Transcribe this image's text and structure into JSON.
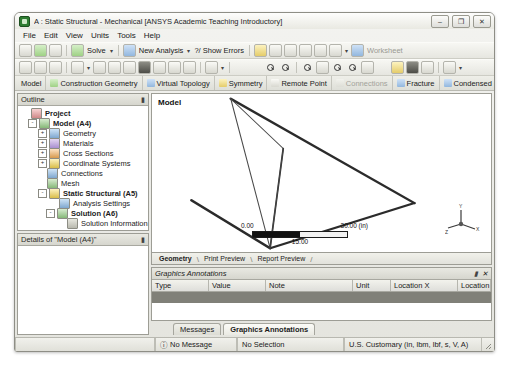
{
  "window": {
    "title": "A : Static Structural - Mechanical [ANSYS Academic Teaching Introductory]",
    "app_icon": "ansys-icon",
    "controls": {
      "minimize": "–",
      "maximize": "❐",
      "close": "✕"
    }
  },
  "menu": {
    "items": [
      "File",
      "Edit",
      "View",
      "Units",
      "Tools",
      "Help"
    ]
  },
  "toolbar1": {
    "solve_label": "Solve",
    "new_analysis_label": "New Analysis",
    "show_errors_label": "?/ Show Errors",
    "worksheet_label": "Worksheet"
  },
  "context_tabs": [
    {
      "label": "Model",
      "icon": "model-icon",
      "enabled": true
    },
    {
      "label": "Construction Geometry",
      "icon": "construction-geometry-icon",
      "enabled": true
    },
    {
      "label": "Virtual Topology",
      "icon": "virtual-topology-icon",
      "enabled": true
    },
    {
      "label": "Symmetry",
      "icon": "symmetry-icon",
      "enabled": true
    },
    {
      "label": "Remote Point",
      "icon": "remote-point-icon",
      "enabled": true
    },
    {
      "label": "Connections",
      "icon": "connections-icon",
      "enabled": false
    },
    {
      "label": "Fracture",
      "icon": "fracture-icon",
      "enabled": true
    },
    {
      "label": "Condensed G",
      "icon": "condensed-geometry-icon",
      "enabled": true
    }
  ],
  "outline": {
    "title": "Outline",
    "pin": "▮",
    "nodes": [
      {
        "label": "Project",
        "indent": 0,
        "expander": "none",
        "icon": "project-icon",
        "bold": true
      },
      {
        "label": "Model (A4)",
        "indent": 1,
        "expander": "-",
        "icon": "model-icon",
        "bold": true
      },
      {
        "label": "Geometry",
        "indent": 2,
        "expander": "+",
        "icon": "geometry-icon",
        "bold": false
      },
      {
        "label": "Materials",
        "indent": 2,
        "expander": "+",
        "icon": "materials-icon",
        "bold": false
      },
      {
        "label": "Cross Sections",
        "indent": 2,
        "expander": "+",
        "icon": "cross-sections-icon",
        "bold": false
      },
      {
        "label": "Coordinate Systems",
        "indent": 2,
        "expander": "+",
        "icon": "coordinate-systems-icon",
        "bold": false
      },
      {
        "label": "Connections",
        "indent": 2,
        "expander": "none",
        "icon": "connections-icon",
        "bold": false
      },
      {
        "label": "Mesh",
        "indent": 2,
        "expander": "none",
        "icon": "mesh-icon",
        "bold": false
      },
      {
        "label": "Static Structural (A5)",
        "indent": 2,
        "expander": "-",
        "icon": "static-structural-icon",
        "bold": true
      },
      {
        "label": "Analysis Settings",
        "indent": 3,
        "expander": "none",
        "icon": "analysis-settings-icon",
        "bold": false
      },
      {
        "label": "Solution (A6)",
        "indent": 3,
        "expander": "-",
        "icon": "solution-icon",
        "bold": true
      },
      {
        "label": "Solution Information",
        "indent": 4,
        "expander": "none",
        "icon": "solution-information-icon",
        "bold": false
      }
    ]
  },
  "details": {
    "title": "Details of \"Model (A4)\"",
    "pin": "▮"
  },
  "graphics": {
    "label": "Model",
    "scale": {
      "min": "0.00",
      "mid": "15.00",
      "max": "30.00 (in)"
    },
    "triad": {
      "x": "X",
      "y": "Y",
      "z": "Z"
    }
  },
  "view_tabs": [
    {
      "label": "Geometry",
      "active": true
    },
    {
      "label": "Print Preview",
      "active": false
    },
    {
      "label": "Report Preview",
      "active": false
    }
  ],
  "graphics_annotations": {
    "title": "Graphics Annotations",
    "pin": "▮",
    "close": "✕",
    "columns": [
      "Type",
      "Value",
      "Note",
      "Unit",
      "Location X",
      "Location Y"
    ]
  },
  "bottom_tabs": [
    {
      "label": "Messages",
      "active": false
    },
    {
      "label": "Graphics Annotations",
      "active": true
    }
  ],
  "status_bar": {
    "message": "No Message",
    "message_icon": "info-icon",
    "selection": "No Selection",
    "units": "U.S. Customary (in, lbm, lbf, s, V, A)"
  }
}
